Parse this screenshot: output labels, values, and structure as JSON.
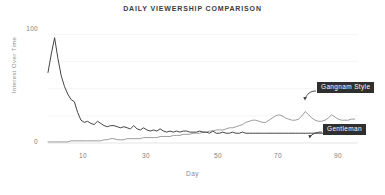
{
  "chart_data": {
    "type": "line",
    "title": "DAILY VIEWERSHIP COMPARISON",
    "xlabel": "Day",
    "ylabel": "Interest Over Time",
    "xlim": [
      1,
      95
    ],
    "ylim": [
      0,
      105
    ],
    "grid": true,
    "grid_axis": "y",
    "legend_position": "inline-annotation",
    "y_ticks": [
      "100",
      "0"
    ],
    "y_tick_values": [
      100,
      0
    ],
    "x_ticks": [
      "10",
      "30",
      "50",
      "70",
      "90"
    ],
    "x_tick_values": [
      10,
      30,
      50,
      70,
      90
    ],
    "series": [
      {
        "name": "Gangnam Style",
        "color": "#8a8a8a",
        "x": [
          1,
          2,
          3,
          4,
          5,
          6,
          7,
          8,
          9,
          10,
          11,
          12,
          13,
          14,
          15,
          16,
          17,
          18,
          19,
          20,
          21,
          22,
          23,
          24,
          25,
          26,
          27,
          28,
          29,
          30,
          31,
          32,
          33,
          34,
          35,
          36,
          37,
          38,
          39,
          40,
          41,
          42,
          43,
          44,
          45,
          46,
          47,
          48,
          49,
          50,
          51,
          52,
          53,
          54,
          55,
          56,
          57,
          58,
          59,
          60,
          61,
          62,
          63,
          64,
          65,
          66,
          67,
          68,
          69,
          70,
          71,
          72,
          73,
          74,
          75,
          76,
          77,
          78,
          79,
          80,
          81,
          82,
          83,
          84,
          85,
          86,
          87,
          88,
          89,
          90,
          91,
          92,
          93,
          94
        ],
        "values": [
          1,
          1,
          1,
          1,
          1,
          1,
          1,
          2,
          2,
          2,
          2,
          2,
          2,
          2,
          2,
          2,
          2,
          3,
          3,
          4,
          4,
          3,
          3,
          3,
          4,
          4,
          4,
          4,
          4,
          5,
          5,
          5,
          5,
          5,
          6,
          6,
          6,
          6,
          7,
          7,
          7,
          8,
          8,
          8,
          9,
          9,
          9,
          10,
          10,
          11,
          11,
          12,
          12,
          12,
          13,
          14,
          14,
          15,
          16,
          17,
          19,
          20,
          21,
          21,
          20,
          19,
          19,
          21,
          23,
          25,
          26,
          25,
          23,
          22,
          21,
          21,
          22,
          25,
          29,
          26,
          23,
          21,
          20,
          20,
          21,
          23,
          26,
          24,
          22,
          21,
          21,
          21,
          22,
          22
        ]
      },
      {
        "name": "Gentleman",
        "color": "#3a3a3a",
        "x": [
          1,
          2,
          3,
          4,
          5,
          6,
          7,
          8,
          9,
          10,
          11,
          12,
          13,
          14,
          15,
          16,
          17,
          18,
          19,
          20,
          21,
          22,
          23,
          24,
          25,
          26,
          27,
          28,
          29,
          30,
          31,
          32,
          33,
          34,
          35,
          36,
          37,
          38,
          39,
          40,
          41,
          42,
          43,
          44,
          45,
          46,
          47,
          48,
          49,
          50,
          51,
          52,
          53,
          54,
          55,
          56,
          57,
          58,
          59,
          60,
          61,
          62,
          63,
          64,
          65,
          66,
          67,
          68,
          69,
          70,
          71,
          72,
          73,
          74,
          75,
          76,
          77,
          78,
          79,
          80,
          81,
          82,
          83,
          84,
          85,
          86,
          87,
          88,
          89,
          90,
          91,
          92,
          93,
          94
        ],
        "values": [
          65,
          82,
          97,
          78,
          62,
          52,
          45,
          40,
          38,
          28,
          21,
          19,
          20,
          18,
          17,
          20,
          18,
          16,
          15,
          16,
          16,
          15,
          14,
          15,
          14,
          13,
          16,
          13,
          12,
          14,
          12,
          11,
          12,
          11,
          13,
          11,
          10,
          11,
          10,
          11,
          10,
          11,
          11,
          10,
          10,
          10,
          11,
          10,
          10,
          9,
          11,
          9,
          9,
          10,
          9,
          9,
          10,
          9,
          9,
          10,
          9,
          9,
          9,
          9,
          9,
          9,
          9,
          9,
          9,
          9,
          9,
          9,
          9,
          9,
          9,
          9,
          9,
          9,
          9,
          9,
          9,
          9,
          9,
          9,
          9,
          9,
          9,
          9,
          9,
          9,
          9,
          9,
          9,
          9
        ]
      }
    ],
    "annotations": [
      {
        "label": "Gangnam Style",
        "series": "Gangnam Style"
      },
      {
        "label": "Gentleman",
        "series": "Gentleman"
      }
    ]
  }
}
